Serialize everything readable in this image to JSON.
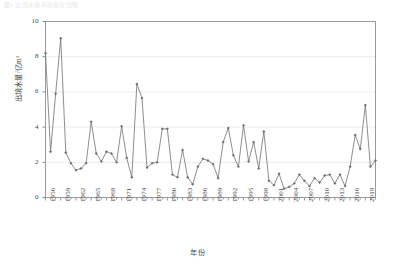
{
  "figure": {
    "top_caption": "图2  出境水量年际变化过程",
    "ylabel": "出境水量/亿m³",
    "xlabel": "年份"
  },
  "chart_data": {
    "type": "line",
    "title": "",
    "xlabel": "年份",
    "ylabel": "出境水量/亿m³",
    "ylim": [
      0,
      10
    ],
    "ytick_labels": [
      "0",
      "2",
      "4",
      "6",
      "8",
      "10"
    ],
    "ytick_values": [
      0,
      2,
      4,
      6,
      8,
      10
    ],
    "xlim": [
      1956,
      2021
    ],
    "xtick_labels": [
      "1956",
      "1959",
      "1962",
      "1965",
      "1968",
      "1971",
      "1974",
      "1977",
      "1980",
      "1983",
      "1986",
      "1989",
      "1992",
      "1995",
      "1998",
      "2001",
      "2004",
      "2007",
      "2010",
      "2013",
      "2016",
      "2019"
    ],
    "xtick_values": [
      1956,
      1959,
      1962,
      1965,
      1968,
      1971,
      1974,
      1977,
      1980,
      1983,
      1986,
      1989,
      1992,
      1995,
      1998,
      2001,
      2004,
      2007,
      2010,
      2013,
      2016,
      2019
    ],
    "grid": "horizontal",
    "legend": null,
    "marker": "diamond",
    "line_color": "#7a7a7a",
    "marker_color": "#6e6e6e",
    "series": [
      {
        "name": "出境水量",
        "x": [
          1956,
          1957,
          1958,
          1959,
          1960,
          1961,
          1962,
          1963,
          1964,
          1965,
          1966,
          1967,
          1968,
          1969,
          1970,
          1971,
          1972,
          1973,
          1974,
          1975,
          1976,
          1977,
          1978,
          1979,
          1980,
          1981,
          1982,
          1983,
          1984,
          1985,
          1986,
          1987,
          1988,
          1989,
          1990,
          1991,
          1992,
          1993,
          1994,
          1995,
          1996,
          1997,
          1998,
          1999,
          2000,
          2001,
          2002,
          2003,
          2004,
          2005,
          2006,
          2007,
          2008,
          2009,
          2010,
          2011,
          2012,
          2013,
          2014,
          2015,
          2016,
          2017,
          2018,
          2019,
          2020,
          2021
        ],
        "values": [
          8.2,
          2.6,
          5.9,
          9.05,
          2.55,
          1.95,
          1.55,
          1.65,
          1.95,
          4.3,
          2.5,
          2.05,
          2.6,
          2.5,
          2.0,
          4.05,
          2.25,
          1.15,
          6.45,
          5.65,
          1.7,
          1.95,
          2.0,
          3.9,
          3.9,
          1.3,
          1.15,
          2.7,
          1.15,
          0.75,
          1.75,
          2.2,
          2.1,
          1.9,
          1.1,
          3.15,
          3.95,
          2.4,
          1.75,
          4.1,
          2.05,
          3.15,
          1.65,
          3.75,
          0.95,
          0.7,
          1.35,
          0.5,
          0.6,
          0.8,
          1.3,
          0.95,
          0.65,
          1.1,
          0.85,
          1.25,
          1.3,
          0.8,
          1.3,
          0.65,
          1.75,
          3.55,
          2.75,
          5.25,
          1.75,
          2.1
        ]
      }
    ]
  }
}
